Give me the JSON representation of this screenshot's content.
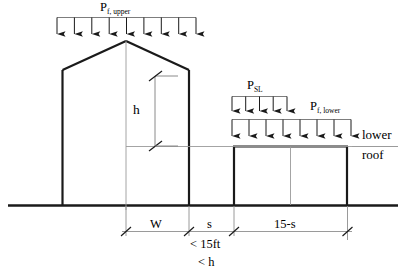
{
  "diagram": {
    "loads": {
      "upper_roof": {
        "symbol": "P",
        "subscript": "f, upper",
        "arrow_count": 9
      },
      "snow_drift": {
        "symbol": "P",
        "subscript": "SL",
        "arrow_count": 5
      },
      "lower_roof": {
        "symbol": "P",
        "subscript": "f, lower",
        "arrow_count": 8
      }
    },
    "annotations": {
      "height": "h",
      "lower_roof_line1": "lower",
      "lower_roof_line2": "roof"
    },
    "dimensions": [
      {
        "label": "W"
      },
      {
        "label": "s"
      },
      {
        "label": "15-s"
      }
    ],
    "constraints": [
      {
        "label": "< 15ft"
      },
      {
        "label": "< h"
      }
    ],
    "colors": {
      "structure": "#1a1a1a",
      "thin_line": "#8f8f8f",
      "background": "#ffffff"
    }
  }
}
